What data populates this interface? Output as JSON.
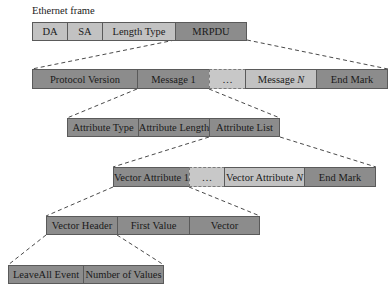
{
  "caption": "Ethernet frame",
  "rows": {
    "ethernet": [
      "DA",
      "SA",
      "Length Type",
      "MRPDU"
    ],
    "mrpdu": [
      "Protocol Version",
      "Message 1",
      "…",
      "Message ",
      "End Mark"
    ],
    "message": [
      "Attribute Type",
      "Attribute Length",
      "Attribute List"
    ],
    "attribute_list": [
      "Vector Attribute 1",
      "…",
      "Vector Attribute ",
      "End Mark"
    ],
    "vector_attribute": [
      "Vector Header",
      "First Value",
      "Vector"
    ],
    "vector_header": [
      "LeaveAll Event",
      "Number of Values"
    ]
  },
  "italic_suffix": "N",
  "colors": {
    "dark": "#8c8c8c",
    "mid": "#a3a3a3",
    "light": "#c2c2c2",
    "border": "#5a5a5a"
  }
}
